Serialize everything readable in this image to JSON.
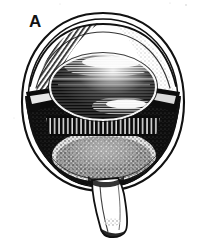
{
  "figure": {
    "panel_label": "A",
    "style": "black-and-white engraved line drawing with stipple and hatching",
    "background_color": "#ffffff",
    "ink_color": "#111111",
    "highlight_color": "#ffffff"
  },
  "structures": [
    {
      "name": "cornea",
      "label": "cornea",
      "description": "transparent anterior arc at top of globe"
    },
    {
      "name": "sclera",
      "label": "sclera",
      "description": "outer white coat drawn as double contour line"
    },
    {
      "name": "iris-left",
      "label": "iris",
      "description": "dark triangular wedge on left of lens"
    },
    {
      "name": "iris-right",
      "label": "iris",
      "description": "dark triangular wedge on right of lens"
    },
    {
      "name": "lens",
      "label": "lens",
      "description": "central ellipse with horizontal hatching and bright highlight bands"
    },
    {
      "name": "ciliary-processes",
      "label": "ciliary processes",
      "description": "radial white striations beneath the lens"
    },
    {
      "name": "vitreous-chamber",
      "label": "vitreous body",
      "description": "large dark posterior chamber with fine stipple"
    },
    {
      "name": "fundus",
      "label": "fundus / retina",
      "description": "bright stippled region at posterior pole"
    },
    {
      "name": "optic-nerve",
      "label": "optic nerve",
      "description": "stalk descending from bottom of globe"
    }
  ],
  "colors": {
    "ink": "#111111",
    "paper": "#ffffff",
    "mid_gray": "#6e6e6e",
    "light_gray": "#c9c9c9"
  }
}
